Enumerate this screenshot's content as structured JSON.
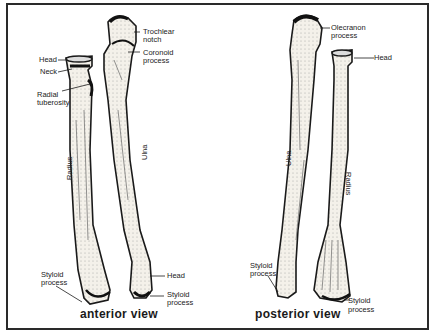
{
  "figure": {
    "panels": [
      {
        "caption": "anterior view",
        "bone_labels": {
          "radius": "Radius",
          "ulna": "Ulna"
        },
        "labels": {
          "radius_head": "Head",
          "radius_neck": "Neck",
          "radial_tuberosity_1": "Radial",
          "radial_tuberosity_2": "tuberosity",
          "trochlear_notch_1": "Trochlear",
          "trochlear_notch_2": "notch",
          "coronoid_process_1": "Coronoid",
          "coronoid_process_2": "process",
          "radius_styloid_1": "Styloid",
          "radius_styloid_2": "process",
          "ulna_head": "Head",
          "ulna_styloid_1": "Styloid",
          "ulna_styloid_2": "process"
        }
      },
      {
        "caption": "posterior view",
        "bone_labels": {
          "ulna": "Ulna",
          "radius": "Radius"
        },
        "labels": {
          "olecranon_process_1": "Olecranon",
          "olecranon_process_2": "process",
          "radius_head": "Head",
          "ulna_styloid_1": "Styloid",
          "ulna_styloid_2": "process",
          "radius_styloid_1": "Styloid",
          "radius_styloid_2": "process"
        }
      }
    ],
    "colors": {
      "ink": "#1a1a1a",
      "bone": "#f4f1ea",
      "shade": "#6b6b6b",
      "frame": "#2a2a2a"
    }
  }
}
